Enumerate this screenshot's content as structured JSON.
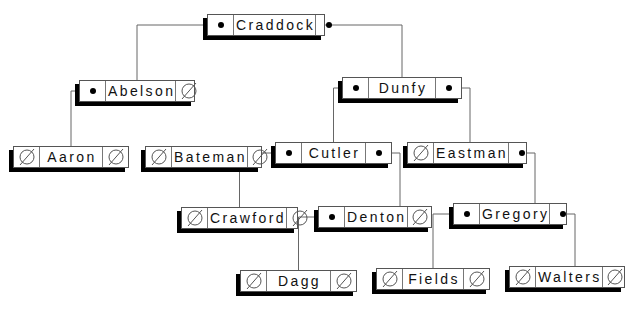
{
  "diagram": {
    "type": "binary-search-tree",
    "colors": {
      "line": "#666666",
      "shadow": "#000000",
      "box": "#ffffff",
      "text": "#111111"
    },
    "nodes": [
      {
        "id": "craddock",
        "label": "Craddock",
        "left": "pointer",
        "right": "pointer",
        "x": 207,
        "y": 14,
        "w": 118
      },
      {
        "id": "abelson",
        "label": "Abelson",
        "left": "pointer",
        "right": "null",
        "x": 79,
        "y": 80,
        "w": 116
      },
      {
        "id": "dunfy",
        "label": "Dunfy",
        "left": "pointer",
        "right": "pointer",
        "x": 342,
        "y": 77,
        "w": 120
      },
      {
        "id": "aaron",
        "label": "Aaron",
        "left": "null",
        "right": "null",
        "x": 13,
        "y": 146,
        "w": 116
      },
      {
        "id": "bateman",
        "label": "Bateman",
        "left": "null",
        "right": "null",
        "x": 145,
        "y": 146,
        "w": 117
      },
      {
        "id": "cutler",
        "label": "Cutler",
        "left": "pointer",
        "right": "pointer",
        "x": 275,
        "y": 142,
        "w": 117
      },
      {
        "id": "eastman",
        "label": "Eastman",
        "left": "null",
        "right": "pointer",
        "x": 407,
        "y": 142,
        "w": 120
      },
      {
        "id": "crawford",
        "label": "Crawford",
        "left": "null",
        "right": "null",
        "x": 181,
        "y": 207,
        "w": 117
      },
      {
        "id": "denton",
        "label": "Denton",
        "left": "pointer",
        "right": "null",
        "x": 318,
        "y": 206,
        "w": 114
      },
      {
        "id": "gregory",
        "label": "Gregory",
        "left": "pointer",
        "right": "pointer",
        "x": 453,
        "y": 203,
        "w": 114
      },
      {
        "id": "dagg",
        "label": "Dagg",
        "left": "null",
        "right": "null",
        "x": 240,
        "y": 270,
        "w": 117
      },
      {
        "id": "fields",
        "label": "Fields",
        "left": "null",
        "right": "null",
        "x": 376,
        "y": 268,
        "w": 114
      },
      {
        "id": "walters",
        "label": "Walters",
        "left": "null",
        "right": "null",
        "x": 509,
        "y": 266,
        "w": 116
      }
    ],
    "edges": [
      {
        "from": "craddock",
        "side": "left",
        "to": "abelson"
      },
      {
        "from": "craddock",
        "side": "right",
        "to": "dunfy"
      },
      {
        "from": "abelson",
        "side": "left",
        "to": "aaron"
      },
      {
        "from": "dunfy",
        "side": "left",
        "to": "cutler"
      },
      {
        "from": "dunfy",
        "side": "right",
        "to": "eastman"
      },
      {
        "from": "cutler",
        "side": "left",
        "to": "crawford"
      },
      {
        "from": "cutler",
        "side": "right",
        "to": "denton"
      },
      {
        "from": "eastman",
        "side": "right",
        "to": "gregory"
      },
      {
        "from": "denton",
        "side": "left",
        "to": "dagg"
      },
      {
        "from": "gregory",
        "side": "left",
        "to": "fields"
      },
      {
        "from": "gregory",
        "side": "right",
        "to": "walters"
      }
    ],
    "icons": {
      "pointer": "filled-dot-icon",
      "null": "null-pointer-icon"
    }
  }
}
